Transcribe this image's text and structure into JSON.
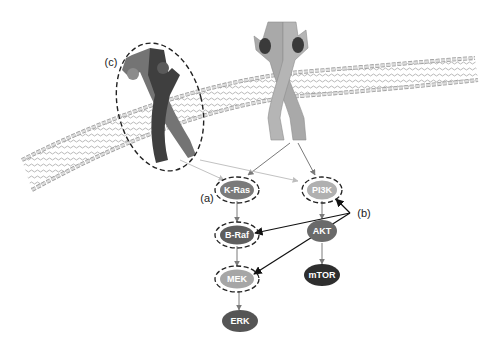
{
  "diagram": {
    "type": "signaling-pathway",
    "membrane": {
      "description": "lipid bilayer"
    },
    "receptors": [
      {
        "id": "receptor-c",
        "description": "dark receptor dimer (mutant / altered)",
        "circled": true,
        "callout": "(c)"
      },
      {
        "id": "receptor-main",
        "description": "light grey receptor dimer with bound ligands",
        "circled": false
      }
    ],
    "nodes": [
      {
        "id": "kras",
        "label": "K-Ras",
        "x": 237,
        "y": 190,
        "fill": "#7a7a7a",
        "dashed_ring": true
      },
      {
        "id": "braf",
        "label": "B-Raf",
        "x": 237,
        "y": 235,
        "fill": "#5e5e5e",
        "dashed_ring": true
      },
      {
        "id": "mek",
        "label": "MEK",
        "x": 237,
        "y": 279,
        "fill": "#a6a6a6",
        "dashed_ring": true
      },
      {
        "id": "erk",
        "label": "ERK",
        "x": 240,
        "y": 321,
        "fill": "#555555",
        "dashed_ring": false
      },
      {
        "id": "pi3k",
        "label": "PI3K",
        "x": 322,
        "y": 190,
        "fill": "#b0b0b0",
        "dashed_ring": true
      },
      {
        "id": "akt",
        "label": "AKT",
        "x": 322,
        "y": 231,
        "fill": "#6a6a6a",
        "dashed_ring": false
      },
      {
        "id": "mtor",
        "label": "mTOR",
        "x": 322,
        "y": 275,
        "fill": "#2e2e2e",
        "dashed_ring": false
      }
    ],
    "edges": [
      {
        "from": "receptor-main",
        "to": "kras"
      },
      {
        "from": "receptor-main",
        "to": "pi3k"
      },
      {
        "from": "receptor-c",
        "to": "kras",
        "style": "light"
      },
      {
        "from": "receptor-c",
        "to": "pi3k",
        "style": "light"
      },
      {
        "from": "kras",
        "to": "braf"
      },
      {
        "from": "braf",
        "to": "mek"
      },
      {
        "from": "mek",
        "to": "erk"
      },
      {
        "from": "pi3k",
        "to": "akt"
      },
      {
        "from": "akt",
        "to": "mtor"
      }
    ],
    "callouts": {
      "a": {
        "label": "(a)",
        "target": "kras"
      },
      "b": {
        "label": "(b)",
        "targets": [
          "pi3k",
          "braf",
          "mek"
        ]
      },
      "c": {
        "label": "(c)",
        "target": "receptor-c"
      }
    },
    "colors": {
      "membrane_head": "#d8d8d8",
      "membrane_stroke": "#8a8a8a",
      "receptor_light": "#a9a9a9",
      "receptor_dark_a": "#6e6e6e",
      "receptor_dark_b": "#3e3e3e",
      "ligand": "#3a3a3a"
    }
  }
}
